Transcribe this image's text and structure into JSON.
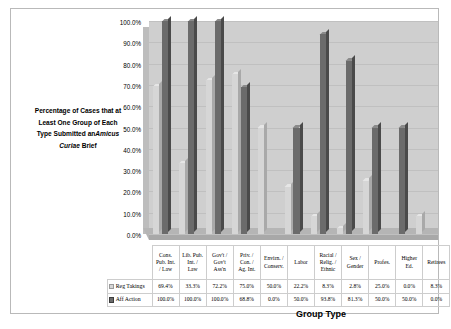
{
  "chart_data": {
    "type": "bar",
    "title_parts": {
      "line1": "Percentage of Cases that at",
      "line2": "Least One Group of Each",
      "line3_pre": "Type Submitted an",
      "line3_italic": "Amicus",
      "line4_italic": "Curiae",
      "line4_post": " Brief"
    },
    "xlabel": "Group Type",
    "ylabel": "",
    "ylim": [
      0,
      100
    ],
    "ytick_labels": [
      "100.0%",
      "90.0%",
      "80.0%",
      "70.0%",
      "60.0%",
      "50.0%",
      "40.0%",
      "30.0%",
      "20.0%",
      "10.0%",
      "0.0%"
    ],
    "ytick_values": [
      100,
      90,
      80,
      70,
      60,
      50,
      40,
      30,
      20,
      10,
      0
    ],
    "grid": true,
    "legend_position": "table-bottom",
    "categories": [
      "Cons. Pub. Int. / Law",
      "Lib. Pub. Int. / Law",
      "Gov't / Gov't Ass'n",
      "Priv. / Con. / Ag. Int.",
      "Envirn. / Conserv.",
      "Labor",
      "Racial / Relig. / Ethnic",
      "Sex / Gender",
      "Profes.",
      "Higher Ed.",
      "Retirees"
    ],
    "category_lines": [
      [
        "Cons.",
        "Pub. Int.",
        "/ Law"
      ],
      [
        "Lib. Pub.",
        "Int. /",
        "Law"
      ],
      [
        "Gov't /",
        "Gov't",
        "Ass'n"
      ],
      [
        "Priv. /",
        "Con. /",
        "Ag. Int."
      ],
      [
        "Envirn. /",
        "Conserv."
      ],
      [
        "Labor"
      ],
      [
        "Racial /",
        "Relig. /",
        "Ethnic"
      ],
      [
        "Sex /",
        "Gender"
      ],
      [
        "Profes."
      ],
      [
        "Higher",
        "Ed."
      ],
      [
        "Retirees"
      ]
    ],
    "series": [
      {
        "name": "Reg Takings",
        "color": "#d6d6d6",
        "values": [
          69.4,
          33.3,
          72.2,
          75.0,
          50.0,
          22.2,
          8.3,
          2.8,
          25.0,
          0.0,
          8.3
        ],
        "labels": [
          "69.4%",
          "33.3%",
          "72.2%",
          "75.0%",
          "50.0%",
          "22.2%",
          "8.3%",
          "2.8%",
          "25.0%",
          "0.0%",
          "8.3%"
        ]
      },
      {
        "name": "Aff Action",
        "color": "#6b6b6b",
        "values": [
          100.0,
          100.0,
          100.0,
          68.8,
          0.0,
          50.0,
          93.8,
          81.3,
          50.0,
          50.0,
          0.0
        ],
        "labels": [
          "100.0%",
          "100.0%",
          "100.0%",
          "68.8%",
          "0.0%",
          "50.0%",
          "93.8%",
          "81.3%",
          "50.0%",
          "50.0%",
          "0.0%"
        ]
      }
    ]
  }
}
